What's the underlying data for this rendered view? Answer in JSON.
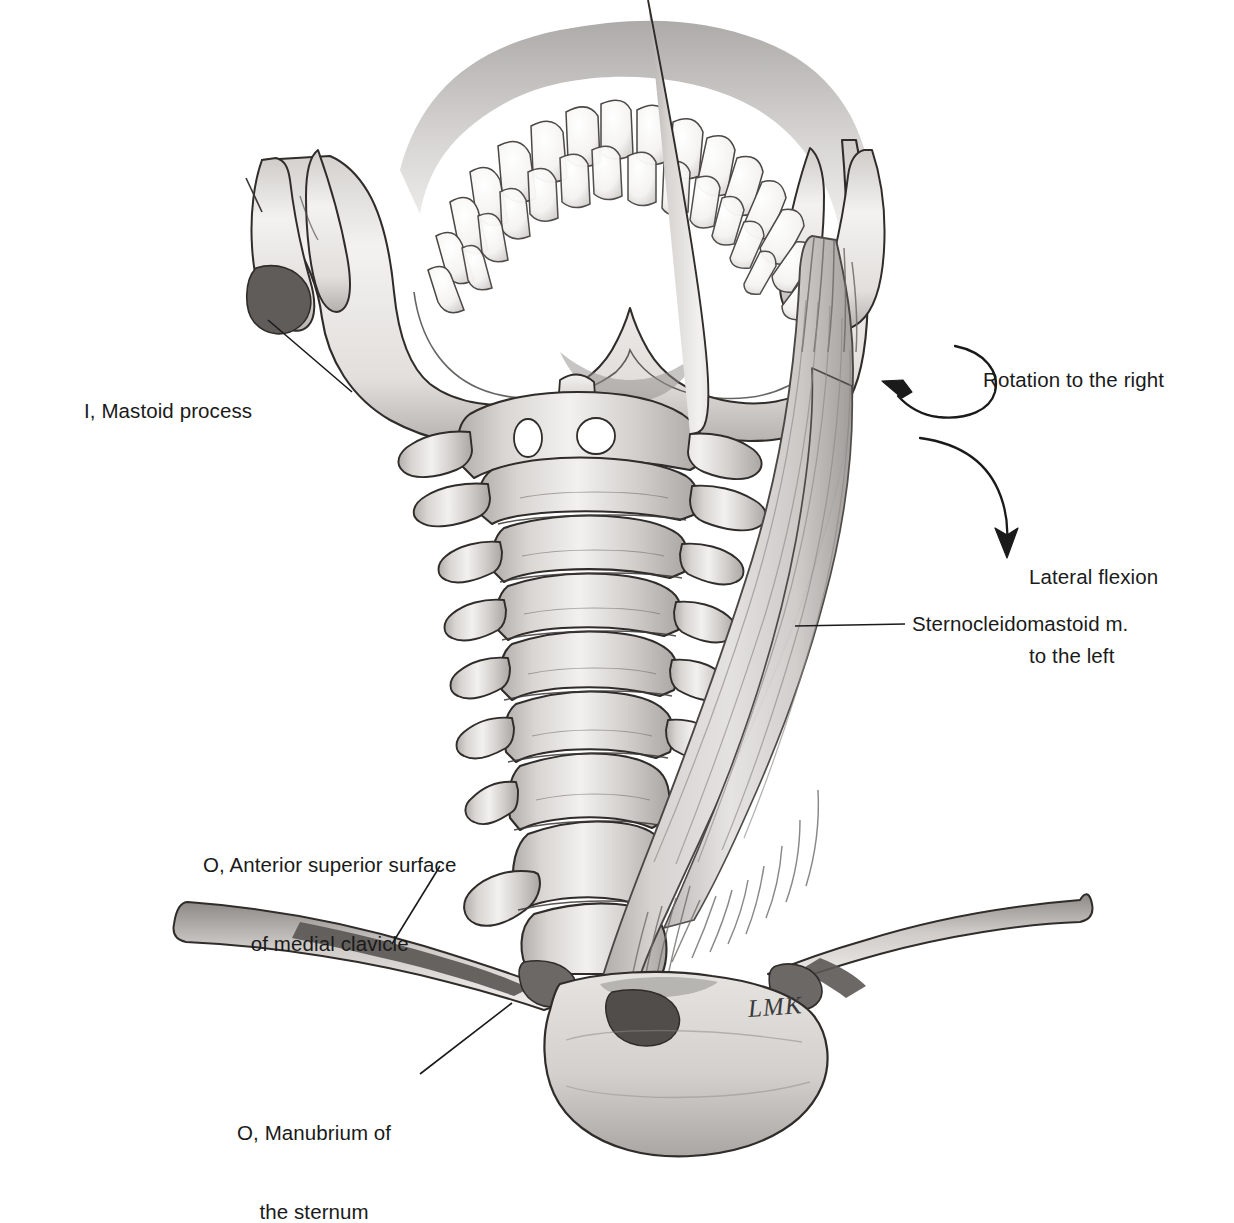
{
  "plate": {
    "title": "Sternocleidomastoid muscle — attachments and actions",
    "background_color": "#ffffff",
    "ink_color": "#1a1a1a",
    "bone_fill": "#e8e6e4",
    "bone_shade": "#b9b6b3",
    "muscle_fill": "#cfcccb",
    "attachment_marker_color": "#5b5855"
  },
  "labels": {
    "mastoid": "I, Mastoid process",
    "rotation": "Rotation to the right",
    "lateral_flexion_line1": "Lateral flexion",
    "lateral_flexion_line2": "to the left",
    "sternocleidomastoid": "Sternocleidomastoid m.",
    "clavicle_line1": "O, Anterior superior surface",
    "clavicle_line2": "of medial clavicle",
    "manubrium_line1": "O, Manubrium of",
    "manubrium_line2": "the sternum"
  },
  "signature": "LMK",
  "structures": [
    {
      "name": "mandible",
      "label": "Mandible with dental arch"
    },
    {
      "name": "teeth",
      "label": "Mandibular teeth",
      "count": 16
    },
    {
      "name": "cervical-spine",
      "label": "Cervical vertebrae",
      "count": 7
    },
    {
      "name": "clavicle-left",
      "label": "Left clavicle"
    },
    {
      "name": "clavicle-right",
      "label": "Right clavicle"
    },
    {
      "name": "manubrium",
      "label": "Manubrium of the sternum"
    },
    {
      "name": "sternocleidomastoid-muscle",
      "label": "Sternocleidomastoid muscle"
    }
  ],
  "attachments": [
    {
      "key": "I",
      "meaning": "Insertion",
      "site": "Mastoid process"
    },
    {
      "key": "O",
      "meaning": "Origin",
      "site": "Anterior superior surface of medial clavicle"
    },
    {
      "key": "O",
      "meaning": "Origin",
      "site": "Manubrium of the sternum"
    }
  ],
  "actions": [
    {
      "name": "rotation",
      "text": "Rotation to the right",
      "arrow": "curved-loop-arrow-left"
    },
    {
      "name": "lateral-flexion",
      "text": "Lateral flexion to the left",
      "arrow": "curved-arrow-down"
    }
  ]
}
